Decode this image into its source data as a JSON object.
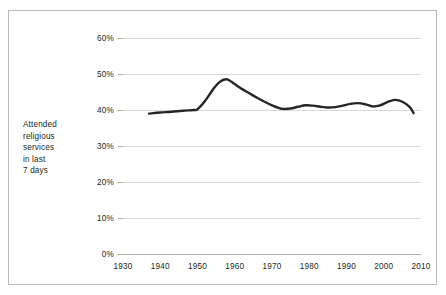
{
  "chart_data": {
    "type": "line",
    "title": "",
    "xlabel": "",
    "ylabel": "Attended religious services in last 7 days",
    "ylabel_lines": [
      "Attended",
      "religious",
      "services",
      "in last",
      "7 days"
    ],
    "xlim": [
      1930,
      2010
    ],
    "ylim": [
      0,
      60
    ],
    "grid": true,
    "legend": false,
    "y_ticks": [
      0,
      10,
      20,
      30,
      40,
      50,
      60
    ],
    "y_tick_labels": [
      "0%",
      "10%",
      "20%",
      "30%",
      "40%",
      "50%",
      "60%"
    ],
    "x_ticks": [
      1930,
      1940,
      1950,
      1960,
      1970,
      1980,
      1990,
      2000,
      2010
    ],
    "x_tick_labels": [
      "1930",
      "1940",
      "1950",
      "1960",
      "1970",
      "1980",
      "1990",
      "2000",
      "2010"
    ],
    "series": [
      {
        "name": "Attended religious services in last 7 days",
        "color": "#262626",
        "x": [
          1937,
          1940,
          1943,
          1946,
          1949,
          1950,
          1952,
          1954,
          1955,
          1956,
          1957,
          1958,
          1959,
          1960,
          1962,
          1964,
          1966,
          1968,
          1970,
          1972,
          1973,
          1975,
          1977,
          1979,
          1981,
          1983,
          1985,
          1987,
          1989,
          1991,
          1993,
          1995,
          1997,
          1999,
          2001,
          2003,
          2005,
          2007,
          2008
        ],
        "y": [
          39.0,
          39.3,
          39.5,
          39.8,
          40.0,
          40.2,
          42.5,
          45.5,
          46.8,
          47.8,
          48.4,
          48.5,
          47.9,
          47.2,
          45.8,
          44.6,
          43.4,
          42.3,
          41.3,
          40.5,
          40.3,
          40.4,
          40.9,
          41.3,
          41.2,
          40.9,
          40.7,
          40.8,
          41.2,
          41.7,
          41.9,
          41.6,
          41.0,
          41.3,
          42.2,
          42.8,
          42.3,
          40.8,
          39.1
        ]
      }
    ]
  },
  "figure": {
    "border_color": "#b9b9b9",
    "background": "#ffffff",
    "gridline_color": "#c8c8c8",
    "axis_color": "#9e9e9e",
    "text_color": "#231f20"
  }
}
